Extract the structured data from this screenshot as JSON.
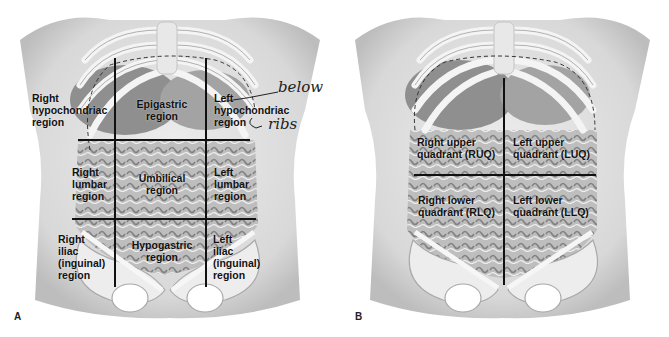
{
  "figure": {
    "panel_a": {
      "letter": "A",
      "regions": [
        {
          "id": "right-hypochondriac",
          "text": "Right\nhypochondriac\nregion"
        },
        {
          "id": "epigastric",
          "text": "Epigastric\nregion"
        },
        {
          "id": "left-hypochondriac",
          "text": "Left\nhypochondriac\nregion"
        },
        {
          "id": "right-lumbar",
          "text": "Right\nlumbar\nregion"
        },
        {
          "id": "umbilical",
          "text": "Umbilical\nregion"
        },
        {
          "id": "left-lumbar",
          "text": "Left\nlumbar\nregion"
        },
        {
          "id": "right-iliac",
          "text": "Right\niliac\n(inguinal)\nregion"
        },
        {
          "id": "hypogastric",
          "text": "Hypogastric\nregion"
        },
        {
          "id": "left-iliac",
          "text": "Left\niliac\n(inguinal)\nregion"
        }
      ],
      "annotations": {
        "handwritten_1": "below",
        "handwritten_2": "ribs"
      }
    },
    "panel_b": {
      "letter": "B",
      "quadrants": [
        {
          "id": "ruq",
          "text": "Right upper\nquadrant (RUQ)"
        },
        {
          "id": "luq",
          "text": "Left upper\nquadrant (LUQ)"
        },
        {
          "id": "rlq",
          "text": "Right lower\nquadrant (RLQ)"
        },
        {
          "id": "llq",
          "text": "Left lower\nquadrant (LLQ)"
        }
      ]
    },
    "colors": {
      "background": "#ffffff",
      "line": "#111111",
      "skin": "#e4e4e4",
      "bone": "#f2f2f2",
      "organ": "#9a9a9a"
    }
  }
}
